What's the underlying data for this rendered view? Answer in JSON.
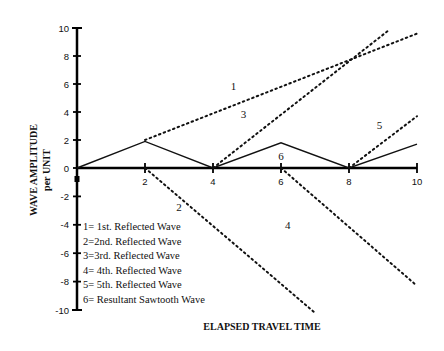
{
  "chart_data": {
    "type": "line",
    "title": "",
    "xlabel": "ELAPSED TRAVEL TIME",
    "ylabel": [
      "WAVE AMPLITUDE",
      "per UNIT"
    ],
    "xlim": [
      0,
      10
    ],
    "ylim": [
      -10,
      10
    ],
    "x_ticks": [
      "2",
      "4",
      "6",
      "8",
      "10"
    ],
    "y_ticks": [
      "10",
      "8",
      "6",
      "4",
      "2",
      "0",
      "-2",
      "-4",
      "-6",
      "-8",
      "-10"
    ],
    "grid": false,
    "series": [
      {
        "name": "1st. Reflected Wave",
        "id": "1",
        "style": "dotted",
        "points": [
          [
            2,
            2
          ],
          [
            10,
            9.6
          ]
        ],
        "label_pos": [
          4.6,
          5.6
        ]
      },
      {
        "name": "2nd. Reflected Wave",
        "id": "2",
        "style": "dotted",
        "points": [
          [
            2,
            0
          ],
          [
            7,
            -10.2
          ]
        ],
        "label_pos": [
          3.0,
          -3.0
        ]
      },
      {
        "name": "3rd. Reflected Wave",
        "id": "3",
        "style": "dotted",
        "points": [
          [
            4,
            0
          ],
          [
            9.2,
            9.9
          ]
        ],
        "label_pos": [
          4.9,
          3.6
        ]
      },
      {
        "name": "4th. Reflected Wave",
        "id": "4",
        "style": "dotted",
        "points": [
          [
            6,
            0
          ],
          [
            10,
            -8.3
          ]
        ],
        "label_pos": [
          6.2,
          -4.3
        ]
      },
      {
        "name": "5th. Reflected Wave",
        "id": "5",
        "style": "dotted",
        "points": [
          [
            8,
            0
          ],
          [
            10,
            3.7
          ]
        ],
        "label_pos": [
          8.9,
          2.8
        ]
      },
      {
        "name": "Resultant Sawtooth Wave",
        "id": "6",
        "style": "solid",
        "points": [
          [
            0,
            0
          ],
          [
            2,
            1.9
          ],
          [
            4,
            0
          ],
          [
            6,
            1.8
          ],
          [
            8,
            0
          ],
          [
            10,
            1.7
          ]
        ],
        "label_pos": [
          6.0,
          0.6
        ]
      }
    ],
    "legend": [
      "1= 1st. Reflected Wave",
      "2=2nd. Reflected Wave",
      "3=3rd. Reflected Wave",
      "4= 4th. Reflected Wave",
      "5= 5th. Reflected Wave",
      "6= Resultant Sawtooth Wave"
    ],
    "legend_position": "lower-left inside plot"
  }
}
